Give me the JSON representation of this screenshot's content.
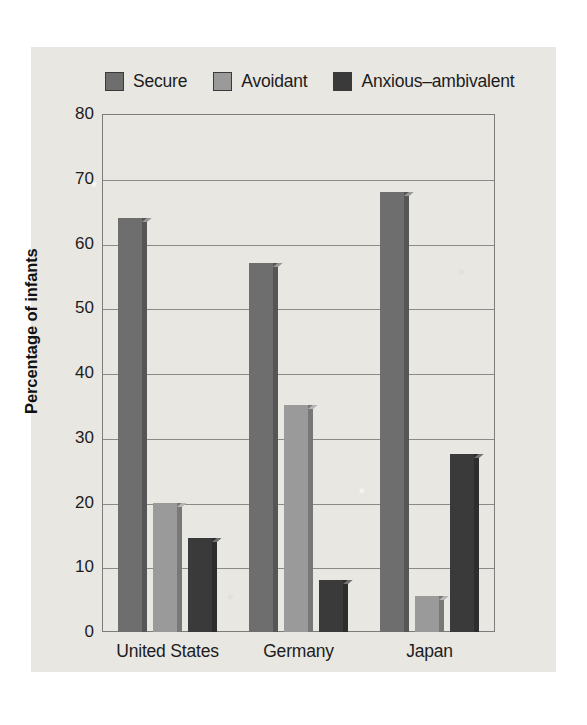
{
  "chart_data": {
    "type": "bar",
    "title": "",
    "subtitle": "",
    "xlabel": "",
    "ylabel": "Percentage of infants",
    "ylim": [
      0,
      80
    ],
    "ytick_step": 10,
    "yticks": [
      "0",
      "10",
      "20",
      "30",
      "40",
      "50",
      "60",
      "70",
      "80"
    ],
    "grid": true,
    "legend_position": "top",
    "categories": [
      "United States",
      "Germany",
      "Japan"
    ],
    "series": [
      {
        "name": "Secure",
        "color": "#6e6e6e",
        "values": [
          64,
          57,
          68
        ]
      },
      {
        "name": "Avoidant",
        "color": "#9a9a9a",
        "values": [
          20,
          35,
          5.5
        ]
      },
      {
        "name": "Anxious–ambivalent",
        "color": "#3a3a3a",
        "values": [
          14.5,
          8,
          27.5
        ]
      }
    ]
  },
  "legend": {
    "items": [
      {
        "label": "Secure"
      },
      {
        "label": "Avoidant"
      },
      {
        "label": "Anxious–ambivalent"
      }
    ]
  },
  "axes": {
    "y_title": "Percentage of infants"
  },
  "colors": {
    "page_background": "#e9e7e2",
    "frame": "#7c7c7c",
    "gridline": "#8a8a8a",
    "text": "#1c1c1c",
    "secure": "#6e6e6e",
    "avoidant": "#9a9a9a",
    "anxious": "#3a3a3a"
  }
}
